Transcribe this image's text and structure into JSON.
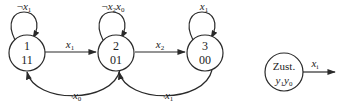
{
  "states": [
    {
      "id": "1",
      "number": "1",
      "output": "11"
    },
    {
      "id": "2",
      "number": "2",
      "output": "01"
    },
    {
      "id": "3",
      "number": "3",
      "output": "00"
    }
  ],
  "transitions": {
    "s1_loop": {
      "neg": "¬",
      "var": "x",
      "sub": "1"
    },
    "s1_to_s2": {
      "var": "x",
      "sub": "1"
    },
    "s2_loop": {
      "neg": "¬",
      "var1": "x",
      "sub1": "2",
      "var2": "x",
      "sub2": "0"
    },
    "s2_to_s3": {
      "var": "x",
      "sub": "2"
    },
    "s3_loop": {
      "var": "x",
      "sub": "1"
    },
    "s2_to_s1": {
      "neg": "¬",
      "var": "x",
      "sub": "0"
    },
    "s3_to_s2": {
      "neg": "¬",
      "var": "x",
      "sub": "1"
    }
  },
  "legend": {
    "title": "Zust.",
    "outputs_var1": "y",
    "outputs_sub1": "1",
    "outputs_var2": "y",
    "outputs_sub2": "0",
    "edge_var": "x",
    "edge_sub": "i"
  }
}
